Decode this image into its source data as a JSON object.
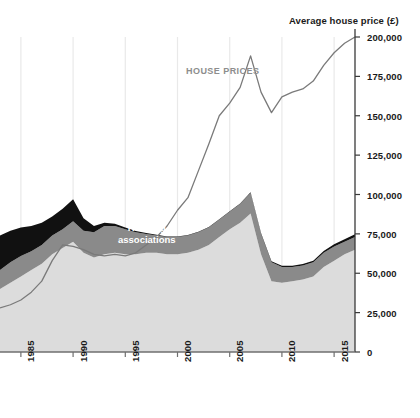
{
  "chart": {
    "type": "area",
    "axis_title_y": "Average house price (£)",
    "annotations": {
      "house_prices": "HOUSE PRICES",
      "housing_associations_line1": "Housing",
      "housing_associations_line2": "associations"
    }
  },
  "chart_data": {
    "type": "area",
    "title": "",
    "subtitle": "",
    "xlabel": "",
    "ylabel": "Average house price (£)",
    "ylim": [
      0,
      200000
    ],
    "xlim": [
      1983,
      2017
    ],
    "grid": "vertical",
    "legend": "none",
    "y_ticks": [
      0,
      25000,
      50000,
      75000,
      100000,
      125000,
      150000,
      175000,
      200000
    ],
    "y_tick_labels": [
      "0",
      "25,000",
      "50,000",
      "75,000",
      "100,000",
      "125,000",
      "150,000",
      "175,000",
      "200,000"
    ],
    "x_ticks": [
      1985,
      1990,
      1995,
      2000,
      2005,
      2010,
      2015
    ],
    "x_tick_labels": [
      "1985",
      "1990",
      "1995",
      "2000",
      "2005",
      "2010",
      "2015"
    ],
    "stacked": true,
    "x": [
      1983,
      1984,
      1985,
      1986,
      1987,
      1988,
      1989,
      1990,
      1991,
      1992,
      1993,
      1994,
      1995,
      1996,
      1997,
      1998,
      1999,
      2000,
      2001,
      2002,
      2003,
      2004,
      2005,
      2006,
      2007,
      2008,
      2009,
      2010,
      2011,
      2012,
      2013,
      2014,
      2015,
      2016,
      2017
    ],
    "series": [
      {
        "name": "Private enterprise",
        "color": "#dcdcdc",
        "values": [
          40000,
          44000,
          48000,
          52000,
          56000,
          62000,
          66000,
          70000,
          63000,
          60000,
          62000,
          63000,
          62000,
          62000,
          63000,
          63000,
          62000,
          62000,
          63000,
          65000,
          68000,
          73000,
          78000,
          82000,
          88000,
          62000,
          45000,
          44000,
          45000,
          46000,
          48000,
          54000,
          58000,
          62000,
          65000
        ]
      },
      {
        "name": "Housing associations",
        "color": "#8a8a8a",
        "values": [
          12000,
          13000,
          13000,
          12000,
          12000,
          12000,
          12000,
          13000,
          14000,
          16000,
          18000,
          17000,
          16000,
          14000,
          12000,
          11000,
          11000,
          11000,
          11000,
          11000,
          11000,
          11000,
          11000,
          12000,
          13000,
          13000,
          12000,
          10000,
          9000,
          9000,
          9000,
          9000,
          9000,
          8000,
          8000
        ]
      },
      {
        "name": "Local authorities",
        "color": "#111111",
        "values": [
          22000,
          20000,
          18000,
          16000,
          14000,
          12000,
          13000,
          14000,
          8000,
          4000,
          2000,
          1500,
          1000,
          800,
          500,
          400,
          300,
          300,
          300,
          300,
          300,
          300,
          300,
          300,
          400,
          500,
          600,
          700,
          800,
          900,
          1000,
          1200,
          1400,
          1600,
          1800
        ]
      }
    ],
    "line_series": {
      "name": "HOUSE PRICES",
      "color": "#7a7a7a",
      "values": [
        28000,
        30000,
        33000,
        38000,
        45000,
        58000,
        68000,
        67000,
        65000,
        62000,
        61000,
        62000,
        61000,
        63000,
        68000,
        73000,
        80000,
        90000,
        98000,
        115000,
        132000,
        150000,
        158000,
        168000,
        188000,
        165000,
        152000,
        162000,
        165000,
        167000,
        172000,
        182000,
        190000,
        196000,
        200000
      ]
    }
  }
}
